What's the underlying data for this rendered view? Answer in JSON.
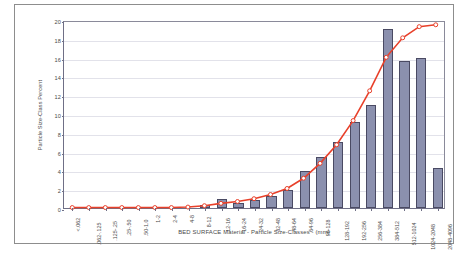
{
  "chart_data": {
    "type": "bar",
    "title": "",
    "xlabel": "BED SURFACE Material  -  Particle Size-Classes  -  (mm)",
    "ylabel": "Particle Size-Class Percent",
    "ylim": [
      0,
      20
    ],
    "yticks": [
      0,
      2,
      4,
      6,
      8,
      10,
      12,
      14,
      16,
      18,
      20
    ],
    "grid": true,
    "legend": "none",
    "categories": [
      "<.062",
      ".062-.125",
      ".125-.25",
      ".25-.50",
      ".50-1.0",
      "1-2",
      "2-4",
      "4-8",
      "8-12",
      "12-16",
      "16-24",
      "24-32",
      "32-48",
      "48-64",
      "64-96",
      "96-128",
      "128-192",
      "192-256",
      "256-384",
      "384-512",
      "512-1024",
      "1024-2048",
      "2048-4096"
    ],
    "series": [
      {
        "name": "Particle Size-Class Percent",
        "type": "bar",
        "color": "#8b90ae",
        "values": [
          0.0,
          0.0,
          0.0,
          0.0,
          0.0,
          0.0,
          0.0,
          0.0,
          0.3,
          1.0,
          0.5,
          0.9,
          1.3,
          1.9,
          3.9,
          5.4,
          7.0,
          9.1,
          11.0,
          19.0,
          15.6,
          16.0,
          4.3
        ]
      },
      {
        "name": "Cumulative Percent (scaled)",
        "type": "line",
        "color": "#e8402a",
        "marker": "open-circle",
        "values": [
          0.05,
          0.05,
          0.05,
          0.05,
          0.05,
          0.05,
          0.05,
          0.1,
          0.25,
          0.5,
          0.7,
          1.0,
          1.45,
          2.1,
          3.2,
          4.8,
          6.8,
          9.4,
          12.6,
          16.2,
          18.3,
          19.5,
          19.7
        ]
      }
    ]
  }
}
